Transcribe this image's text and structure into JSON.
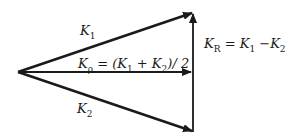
{
  "diagram": {
    "type": "vector-diagram",
    "stroke_color": "#1a1a1a",
    "background": "#ffffff",
    "vectors": [
      {
        "name": "K1",
        "from": [
          18,
          72
        ],
        "to": [
          193,
          12
        ]
      },
      {
        "name": "Kp",
        "from": [
          18,
          72
        ],
        "to": [
          193,
          72
        ]
      },
      {
        "name": "K2",
        "from": [
          18,
          72
        ],
        "to": [
          193,
          132
        ]
      },
      {
        "name": "KR",
        "from": [
          193,
          132
        ],
        "to": [
          193,
          12
        ]
      }
    ],
    "labels": {
      "k1": {
        "main": "K",
        "sub": "1"
      },
      "k2": {
        "main": "K",
        "sub": "2"
      },
      "kp": {
        "main": "K",
        "sub": "ρ",
        "rest_a": " = (K",
        "sub1": "1",
        "rest_b": " + K",
        "sub2": "2",
        "rest_c": ")/ 2"
      },
      "kr": {
        "main": "K",
        "sub": "R",
        "rest_a": " = K",
        "sub1": "1",
        "rest_b": " −K",
        "sub2": "2"
      }
    }
  }
}
